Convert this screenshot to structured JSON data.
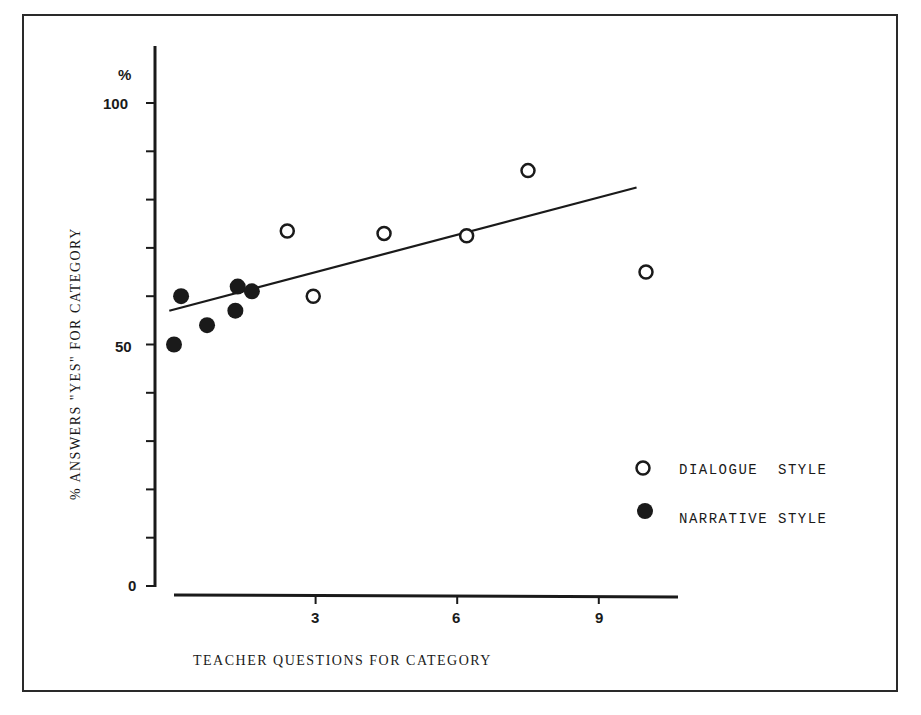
{
  "chart_data": {
    "type": "scatter",
    "title": "",
    "xlabel": "TEACHER QUESTIONS FOR CATEGORY",
    "ylabel": "% ANSWERS \"YES\" FOR CATEGORY",
    "y_unit_label": "%",
    "xlim": [
      0,
      10.6
    ],
    "ylim": [
      0,
      100
    ],
    "x_ticks": [
      3,
      6,
      9
    ],
    "y_ticks_labeled": [
      0,
      50,
      100
    ],
    "y_minor_tick_step": 10,
    "grid": false,
    "legend_position": "lower right",
    "series": [
      {
        "name": "DIALOGUE STYLE",
        "marker": "open-circle",
        "points": [
          {
            "x": 2.4,
            "y": 73.5
          },
          {
            "x": 2.95,
            "y": 60
          },
          {
            "x": 4.45,
            "y": 73
          },
          {
            "x": 6.2,
            "y": 72.5
          },
          {
            "x": 7.5,
            "y": 86
          },
          {
            "x": 10.0,
            "y": 65
          }
        ]
      },
      {
        "name": "NARRATIVE STYLE",
        "marker": "filled-circle",
        "points": [
          {
            "x": 0.0,
            "y": 50
          },
          {
            "x": 0.15,
            "y": 60
          },
          {
            "x": 0.7,
            "y": 54
          },
          {
            "x": 1.3,
            "y": 57
          },
          {
            "x": 1.35,
            "y": 62
          },
          {
            "x": 1.65,
            "y": 61
          }
        ]
      }
    ],
    "trend_line": {
      "x1": -0.1,
      "y1": 57,
      "x2": 9.8,
      "y2": 82.5
    }
  },
  "axis_labels": {
    "y_unit": "%",
    "y_ticks": {
      "y0": "0",
      "y50": "50",
      "y100": "100"
    },
    "x_ticks": {
      "x3": "3",
      "x6": "6",
      "x9": "9"
    },
    "x_title": "TEACHER QUESTIONS FOR CATEGORY",
    "y_title": "% ANSWERS \"YES\" FOR CATEGORY"
  },
  "legend": {
    "dialogue": "DIALOGUE  STYLE",
    "narrative": "NARRATIVE STYLE"
  },
  "colors": {
    "ink": "#1a1a1a",
    "background": "#ffffff"
  }
}
